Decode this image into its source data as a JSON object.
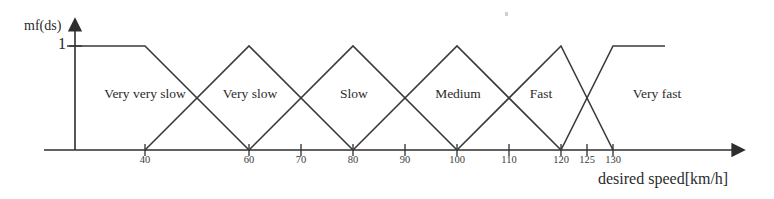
{
  "chart_data": {
    "type": "line",
    "title": "",
    "subtitle": "",
    "xlabel": "desired speed[km/h]",
    "ylabel": "mf(ds)",
    "xlim": [
      25,
      140
    ],
    "ylim": [
      0,
      1
    ],
    "grid": false,
    "legend": "none",
    "y_tick_labels": [
      "1"
    ],
    "y_ticks": [
      1
    ],
    "x_ticks": [
      40,
      60,
      70,
      80,
      90,
      100,
      110,
      120,
      125,
      130
    ],
    "x_tick_labels": [
      "40",
      "60",
      "70",
      "80",
      "90",
      "100",
      "110",
      "120",
      "125",
      "130"
    ],
    "annotations": [
      "Very very slow",
      "Very slow",
      "Slow",
      "Medium",
      "Fast",
      "Very fast"
    ],
    "series": [
      {
        "name": "Very very slow",
        "label_x": 60,
        "points": [
          [
            25,
            1
          ],
          [
            40,
            1
          ],
          [
            60,
            0
          ]
        ]
      },
      {
        "name": "Very slow",
        "label_x": 80,
        "points": [
          [
            40,
            0
          ],
          [
            60,
            1
          ],
          [
            80,
            0
          ]
        ]
      },
      {
        "name": "Slow",
        "label_x": 100,
        "points": [
          [
            60,
            0
          ],
          [
            80,
            1
          ],
          [
            100,
            0
          ]
        ]
      },
      {
        "name": "Medium",
        "label_x": 120,
        "points": [
          [
            80,
            0
          ],
          [
            100,
            1
          ],
          [
            120,
            0
          ]
        ]
      },
      {
        "name": "Fast",
        "label_x": 136,
        "points": [
          [
            100,
            0
          ],
          [
            120,
            1
          ],
          [
            130,
            0
          ]
        ]
      },
      {
        "name": "Very fast",
        "label_x": 160,
        "points": [
          [
            120,
            0
          ],
          [
            130,
            1
          ],
          [
            140,
            1
          ]
        ]
      }
    ]
  },
  "axes": {
    "y_title": "mf(ds)",
    "y_tick_one": "1",
    "x_title": "desired speed[km/h]"
  },
  "set_labels": [
    {
      "text": "Very very slow"
    },
    {
      "text": "Very slow"
    },
    {
      "text": "Slow"
    },
    {
      "text": "Medium"
    },
    {
      "text": "Fast"
    },
    {
      "text": "Very fast"
    }
  ],
  "x_tick_labels": [
    {
      "text": "40"
    },
    {
      "text": "60"
    },
    {
      "text": "70"
    },
    {
      "text": "80"
    },
    {
      "text": "90"
    },
    {
      "text": "100"
    },
    {
      "text": "110"
    },
    {
      "text": "120"
    },
    {
      "text": "125"
    },
    {
      "text": "130"
    }
  ],
  "colors": {
    "line": "#3a3a3a",
    "axis": "#2e2e2e",
    "text": "#2b2b2b",
    "background": "#ffffff"
  }
}
